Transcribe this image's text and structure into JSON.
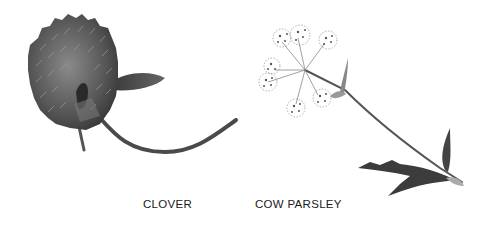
{
  "illustration": {
    "background": "#ffffff",
    "specimens": [
      {
        "name": "clover",
        "label": "CLOVER",
        "tone": "#5a5a5a"
      },
      {
        "name": "cow-parsley",
        "label": "COW PARSLEY",
        "tone": "#6a6a6a"
      }
    ]
  }
}
